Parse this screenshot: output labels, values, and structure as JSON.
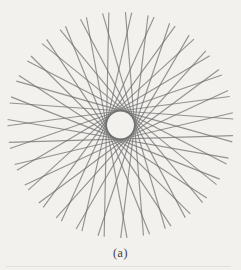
{
  "page": {
    "background_color": "#f2f1ee"
  },
  "figure": {
    "caption": "(a)",
    "pattern": {
      "type": "tangent-line-rosette",
      "num_lines": 31,
      "cx": 120.5,
      "cy": 125,
      "outer_radius": 113,
      "inner_radius": 14,
      "phase_deg": 7,
      "stroke_color": "#6e6e6e",
      "stroke_opacity": 0.72,
      "stroke_width": 1.15
    }
  }
}
